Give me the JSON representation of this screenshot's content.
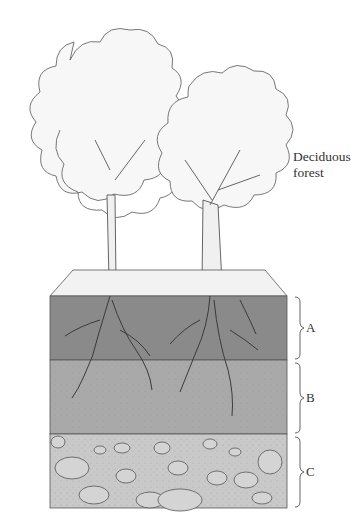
{
  "title_label": {
    "line1": "Deciduous",
    "line2": "forest"
  },
  "horizons": [
    {
      "id": "A",
      "label": "A",
      "color": "#8a8a8a"
    },
    {
      "id": "B",
      "label": "B",
      "color": "#a9a9a9"
    },
    {
      "id": "C",
      "label": "C",
      "color": "#c9c9c9"
    }
  ],
  "colors": {
    "outline": "#4a4a4a",
    "litter": "#f0f0f0",
    "rock": "#d4d4d4"
  }
}
